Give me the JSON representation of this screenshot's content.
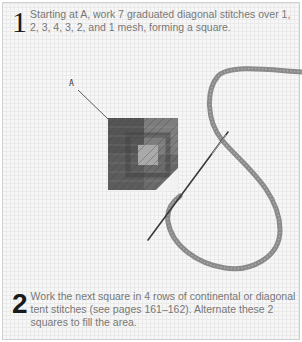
{
  "steps": [
    {
      "number": "1",
      "text": "Starting at A, work 7 graduated diagonal stitches over 1, 2, 3, 4, 3, 2, and 1 mesh, forming a square."
    },
    {
      "number": "2",
      "text": "Work the next square in 4 rows of continental or diagonal tent stitches (see pages 161–162). Alternate these 2 squares to fill the area."
    }
  ],
  "illustration": {
    "callout_label": "A",
    "colors": {
      "dark_stitch": "#4a4a4a",
      "mid_stitch": "#7a7a7a",
      "light_stitch": "#a8a8a8",
      "yarn": "#8a8a8a",
      "needle": "#3a3a3a",
      "mesh": "#e2e2e2"
    }
  }
}
